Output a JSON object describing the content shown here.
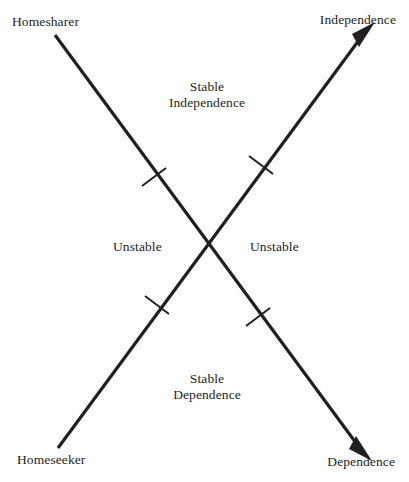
{
  "diagram": {
    "title_visible": false,
    "background_color": "#ffffff",
    "line_color": "#231f20",
    "corner_labels": [
      {
        "id": "homesharer",
        "text": "Homesharer",
        "position": "top-left"
      },
      {
        "id": "independence",
        "text": "Independence",
        "position": "top-right"
      },
      {
        "id": "homeseeker",
        "text": "Homeseeker",
        "position": "bottom-left"
      },
      {
        "id": "dependence",
        "text": "Dependence",
        "position": "bottom-right"
      }
    ],
    "region_labels": [
      {
        "id": "stable-independence",
        "line1": "Stable",
        "line2": "Independence",
        "position": "top-center"
      },
      {
        "id": "unstable-left",
        "text": "Unstable",
        "position": "middle-left"
      },
      {
        "id": "unstable-right",
        "text": "Unstable",
        "position": "middle-right"
      },
      {
        "id": "stable-dependence",
        "line1": "Stable",
        "line2": "Dependence",
        "position": "bottom-center"
      }
    ],
    "axes": [
      {
        "id": "homesharer-dependence-axis",
        "from": "Homesharer",
        "to": "Dependence",
        "arrowheads": [
          "end"
        ],
        "tick_count": 2
      },
      {
        "id": "homeseeker-independence-axis",
        "from": "Homeseeker",
        "to": "Independence",
        "arrowheads": [
          "end"
        ],
        "tick_count": 2
      }
    ],
    "crossing_point": {
      "x": 210,
      "y": 245
    }
  }
}
